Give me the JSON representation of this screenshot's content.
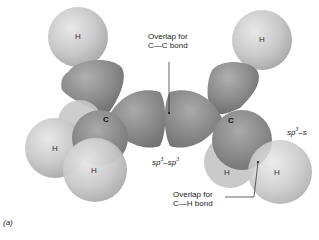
{
  "figure": {
    "panel_label": "(a)",
    "overlap_cc": {
      "line1": "Overlap for",
      "line2": "C—C bond"
    },
    "overlap_ch": {
      "line1": "Overlap for",
      "line2": "C—H bond"
    },
    "sp3_sp3": "sp3–sp3",
    "sp3_s": "sp3–s",
    "atoms": {
      "h_top_left": "H",
      "h_top_right": "H",
      "h_left_1": "H",
      "h_left_2": "H",
      "h_right_1": "H",
      "h_right_2": "H",
      "c_left": "C",
      "c_right": "C"
    }
  }
}
